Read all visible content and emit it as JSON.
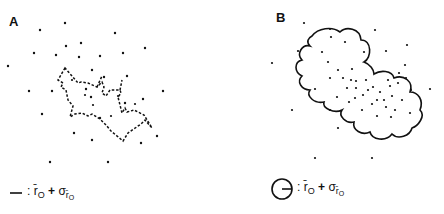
{
  "panels": [
    {
      "label": "A",
      "legend": {
        "symbol": "dash-line",
        "sep": ":",
        "r": "r̄",
        "r_sub": "O",
        "plus": "+",
        "sigma": "σ",
        "sigma_sub": "r̄",
        "sigma_subsub": "O"
      }
    },
    {
      "label": "B",
      "legend": {
        "symbol": "circle-with-radius",
        "sep": ":",
        "r": "r̄",
        "r_sub": "O",
        "plus": "+",
        "sigma": "σ",
        "sigma_sub": "r̄",
        "sigma_subsub": "O"
      }
    }
  ],
  "colors": {
    "ink": "#111111",
    "background": "#ffffff"
  },
  "points_a": [
    [
      65,
      23
    ],
    [
      40,
      30
    ],
    [
      115,
      33
    ],
    [
      34,
      53
    ],
    [
      66,
      46
    ],
    [
      81,
      43
    ],
    [
      56,
      55
    ],
    [
      79,
      57
    ],
    [
      100,
      56
    ],
    [
      123,
      53
    ],
    [
      145,
      48
    ],
    [
      8,
      66
    ],
    [
      92,
      70
    ],
    [
      104,
      77
    ],
    [
      127,
      76
    ],
    [
      29,
      91
    ],
    [
      52,
      91
    ],
    [
      86,
      89
    ],
    [
      91,
      97
    ],
    [
      163,
      91
    ],
    [
      143,
      99
    ],
    [
      42,
      114
    ],
    [
      74,
      133
    ],
    [
      92,
      140
    ],
    [
      141,
      143
    ],
    [
      157,
      136
    ],
    [
      50,
      162
    ],
    [
      108,
      162
    ],
    [
      125,
      103
    ],
    [
      100,
      118
    ]
  ],
  "points_b": [
    [
      304,
      23
    ],
    [
      330,
      29
    ],
    [
      375,
      30
    ],
    [
      407,
      45
    ],
    [
      298,
      51
    ],
    [
      386,
      51
    ],
    [
      272,
      63
    ],
    [
      292,
      110
    ],
    [
      338,
      128
    ],
    [
      315,
      158
    ],
    [
      372,
      158
    ],
    [
      430,
      89
    ],
    [
      315,
      89
    ],
    [
      377,
      100
    ],
    [
      405,
      65
    ],
    [
      331,
      37
    ],
    [
      345,
      42
    ],
    [
      322,
      52
    ],
    [
      364,
      52
    ],
    [
      328,
      62
    ],
    [
      338,
      70
    ],
    [
      352,
      69
    ],
    [
      330,
      78
    ],
    [
      343,
      78
    ],
    [
      351,
      80
    ],
    [
      356,
      81
    ],
    [
      347,
      88
    ],
    [
      356,
      88
    ],
    [
      368,
      90
    ],
    [
      380,
      92
    ],
    [
      363,
      95
    ],
    [
      355,
      98
    ],
    [
      372,
      104
    ],
    [
      386,
      107
    ],
    [
      337,
      97
    ],
    [
      349,
      102
    ],
    [
      330,
      110
    ],
    [
      362,
      110
    ],
    [
      392,
      96
    ],
    [
      406,
      78
    ],
    [
      398,
      83
    ],
    [
      390,
      86
    ],
    [
      402,
      100
    ],
    [
      410,
      113
    ],
    [
      377,
      116
    ],
    [
      391,
      117
    ],
    [
      399,
      73
    ],
    [
      411,
      90
    ],
    [
      388,
      80
    ],
    [
      366,
      80
    ],
    [
      384,
      100
    ],
    [
      395,
      110
    ],
    [
      373,
      87
    ]
  ],
  "points_a_cluster": [
    [
      72,
      80
    ],
    [
      85,
      95
    ],
    [
      93,
      105
    ],
    [
      118,
      96
    ],
    [
      111,
      116
    ],
    [
      135,
      104
    ]
  ]
}
